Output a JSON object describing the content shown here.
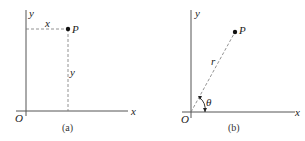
{
  "figure": {
    "panel_a": {
      "caption": "(a)",
      "origin_label": "O",
      "x_axis_label": "x",
      "y_axis_label": "y",
      "point_label": "P",
      "horizontal_dash_label": "x",
      "vertical_dash_label": "y"
    },
    "panel_b": {
      "caption": "(b)",
      "origin_label": "O",
      "x_axis_label": "x",
      "y_axis_label": "y",
      "point_label": "P",
      "radius_label": "r",
      "angle_label": "θ"
    },
    "colors": {
      "ink": "#222222",
      "axis": "#555555",
      "background": "#ffffff"
    }
  }
}
